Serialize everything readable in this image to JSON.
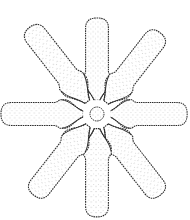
{
  "figure": {
    "arm_count": 8,
    "colors": {
      "outline": "#2a2a2a",
      "stipple": "#9a9a9a",
      "fill": "#ffffff"
    }
  }
}
